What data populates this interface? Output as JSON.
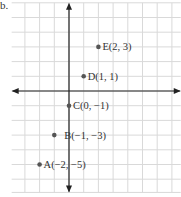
{
  "figure_label": "b.",
  "plane": {
    "origin_px": [
      69,
      91
    ],
    "unit_px": 14.7,
    "grid": {
      "x_min": -3.9,
      "x_max": 7.6,
      "y_min": -6.9,
      "y_max": 6.0,
      "color": "#d9d9d9"
    },
    "axis_color": "#222222"
  },
  "points": [
    {
      "name": "A",
      "x": -2,
      "y": -5,
      "label": "A(−2, −5)"
    },
    {
      "name": "B",
      "x": -1,
      "y": -3,
      "label": "B(−1, −3)"
    },
    {
      "name": "C",
      "x": 0,
      "y": -1,
      "label": "C(0, −1)"
    },
    {
      "name": "D",
      "x": 1,
      "y": 1,
      "label": "D(1, 1)"
    },
    {
      "name": "E",
      "x": 2,
      "y": 3,
      "label": "E(2, 3)"
    }
  ],
  "point_color": "#555555"
}
